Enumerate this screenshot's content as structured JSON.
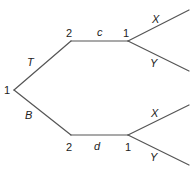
{
  "diagram": {
    "type": "game-tree",
    "colors": {
      "edge": "#555555",
      "text": "#222222",
      "background": "#ffffff"
    },
    "nodes": {
      "root": {
        "player": "1"
      },
      "top_mid": {
        "player": "2"
      },
      "top_right": {
        "player": "1"
      },
      "bottom_mid": {
        "player": "2"
      },
      "bottom_right": {
        "player": "1"
      }
    },
    "edges": {
      "root_top": {
        "action": "T"
      },
      "root_bottom": {
        "action": "B"
      },
      "top_horizontal": {
        "action": "c"
      },
      "bottom_horizontal": {
        "action": "d"
      },
      "top_x": {
        "action": "X"
      },
      "top_y": {
        "action": "Y"
      },
      "bottom_x": {
        "action": "X"
      },
      "bottom_y": {
        "action": "Y"
      }
    }
  }
}
